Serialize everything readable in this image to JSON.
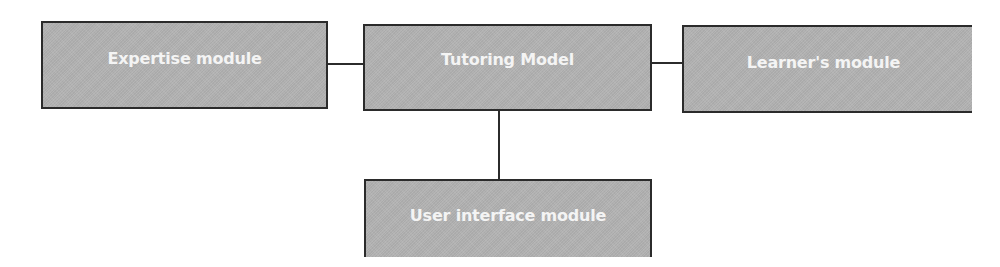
{
  "diagram": {
    "type": "block-diagram",
    "nodes": [
      {
        "id": "expertise",
        "label": "Expertise module"
      },
      {
        "id": "tutoring",
        "label": "Tutoring Model"
      },
      {
        "id": "learner",
        "label": "Learner's module"
      },
      {
        "id": "ui",
        "label": "User interface module"
      }
    ],
    "edges": [
      {
        "from": "expertise",
        "to": "tutoring"
      },
      {
        "from": "tutoring",
        "to": "learner"
      },
      {
        "from": "tutoring",
        "to": "ui"
      }
    ],
    "colors": {
      "box_fill": "#b3b3b3",
      "box_border": "#2b2b2b",
      "label_text": "#f4f4f4",
      "connector": "#2b2b2b",
      "background": "#ffffff"
    }
  }
}
